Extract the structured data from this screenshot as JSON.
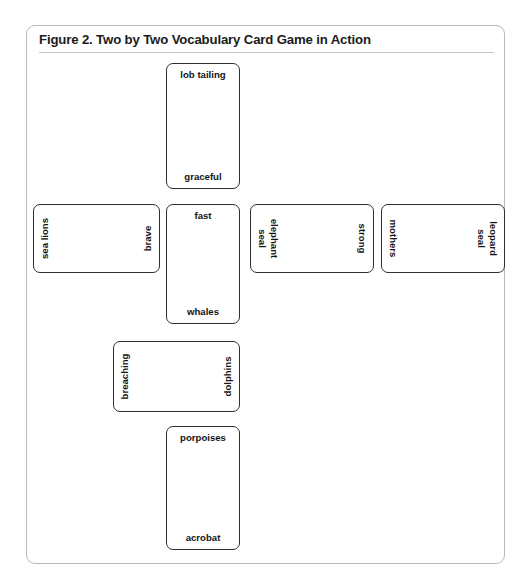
{
  "figure": {
    "caption": "Figure 2. Two by Two Vocabulary Card Game in Action",
    "frame_border_color": "#b9b9b9",
    "card_border_color": "#2f2f2f",
    "background_color": "#ffffff",
    "text_color": "#141414"
  },
  "cards": [
    {
      "id": "lob-tailing",
      "top_label": "lob tailing",
      "bottom_label": "graceful",
      "orientation": "upright"
    },
    {
      "id": "sea-lions",
      "top_label": "sea lions",
      "bottom_label": "brave",
      "orientation": "rotated-ccw"
    },
    {
      "id": "fast-whales",
      "top_label": "fast",
      "bottom_label": "whales",
      "orientation": "upright"
    },
    {
      "id": "strong-elephant-seal",
      "top_label": "strong",
      "bottom_label": "elephant\nseal",
      "orientation": "rotated-cw"
    },
    {
      "id": "leopard-seal-mothers",
      "top_label": "leopard\nseal",
      "bottom_label": "mothers",
      "orientation": "rotated-cw"
    },
    {
      "id": "breaching-dolphins",
      "top_label": "breaching",
      "bottom_label": "dolphins",
      "orientation": "rotated-ccw"
    },
    {
      "id": "porpoises-acrobat",
      "top_label": "porpoises",
      "bottom_label": "acrobat",
      "orientation": "upright"
    }
  ]
}
